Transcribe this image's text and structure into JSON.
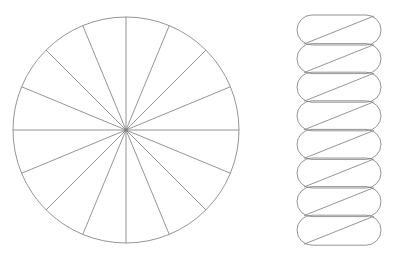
{
  "canvas": {
    "width": 393,
    "height": 257,
    "background_color": "#ffffff"
  },
  "style": {
    "stroke_color": "#7a7a7a",
    "stroke_color_dark": "#5a5a5a",
    "stroke_width": 0.8,
    "fill_color": "none"
  },
  "figure": {
    "kind": "geometry-illustration"
  },
  "circle": {
    "label": "sectored-circle",
    "center_x": 126,
    "center_y": 130,
    "radius": 113,
    "sector_count": 16,
    "sector_angle_degrees": 22.5,
    "start_angle_degrees": 0,
    "stroke_color": "#7a7a7a",
    "stroke_width": 0.8,
    "fill": "none",
    "spoke_angles_degrees": [
      0,
      22.5,
      45,
      67.5,
      90,
      112.5,
      135,
      157.5,
      180,
      202.5,
      225,
      247.5,
      270,
      292.5,
      315,
      337.5
    ]
  },
  "pill_stack": {
    "label": "rearranged-sectors-stack",
    "count": 8,
    "left_x": 297,
    "right_x": 381,
    "width": 84,
    "pill_height": 30,
    "corner_radius": 15,
    "first_top_y": 15,
    "vertical_pitch": 28.6,
    "stroke_color": "#7a7a7a",
    "stroke_width": 0.8,
    "fill": "none",
    "diagonal": {
      "present": true,
      "direction": "bottom-left-to-top-right",
      "inset_x": 7
    },
    "pills": [
      {
        "index": 1,
        "top_y": 15
      },
      {
        "index": 2,
        "top_y": 43.6
      },
      {
        "index": 3,
        "top_y": 72.2
      },
      {
        "index": 4,
        "top_y": 100.8
      },
      {
        "index": 5,
        "top_y": 129.4
      },
      {
        "index": 6,
        "top_y": 158.0
      },
      {
        "index": 7,
        "top_y": 186.6
      },
      {
        "index": 8,
        "top_y": 215.2
      }
    ]
  },
  "chart_data": {
    "type": "diagram",
    "title": "",
    "subtitle": "",
    "annotations": [],
    "legend": [],
    "shapes": [
      {
        "name": "circle-with-16-sectors",
        "type": "circle",
        "cx": 126,
        "cy": 130,
        "r": 113,
        "divisions": 16
      },
      {
        "name": "pill-stack-of-8",
        "type": "stack",
        "items": 8,
        "item_width": 84,
        "item_height": 30
      }
    ]
  }
}
